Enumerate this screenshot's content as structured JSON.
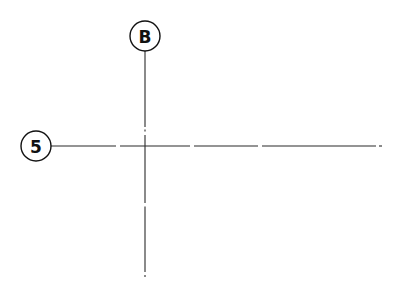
{
  "diagram": {
    "type": "structural-grid",
    "colors": {
      "line": "#2a2a2a",
      "bubble_stroke": "#111111",
      "background": "#ffffff"
    },
    "grid_lines": [
      {
        "id": "grid-B",
        "orientation": "vertical",
        "label": "B",
        "bubble": {
          "cx": 145,
          "cy": 36,
          "r": 15
        },
        "line": {
          "x": 145,
          "y_start": 51,
          "y_end": 277
        },
        "gaps": [
          129,
          134,
          205,
          274
        ]
      },
      {
        "id": "grid-5",
        "orientation": "horizontal",
        "label": "5",
        "bubble": {
          "cx": 36,
          "cy": 146,
          "r": 15
        },
        "line": {
          "y": 146,
          "x_start": 51,
          "x_end": 382
        },
        "gaps": [
          118,
          192,
          260,
          378
        ]
      }
    ],
    "intersection": {
      "x": 145,
      "y": 146
    }
  }
}
